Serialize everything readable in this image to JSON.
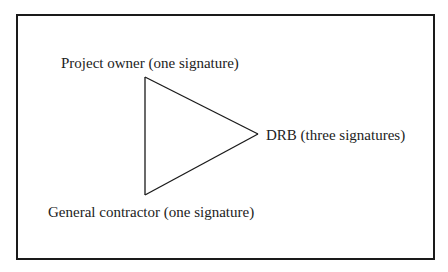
{
  "diagram": {
    "type": "triangle-signature-relationship",
    "nodes": [
      {
        "id": "owner",
        "label": "Project owner (one signature)",
        "position": "top-left vertex"
      },
      {
        "id": "contractor",
        "label": "General contractor (one signature)",
        "position": "bottom-left vertex"
      },
      {
        "id": "drb",
        "label": "DRB (three signatures)",
        "position": "right vertex"
      }
    ],
    "edges": [
      {
        "from": "owner",
        "to": "drb"
      },
      {
        "from": "contractor",
        "to": "drb"
      },
      {
        "from": "owner",
        "to": "contractor"
      }
    ],
    "colors": {
      "stroke": "#1a1a1a",
      "text": "#222222",
      "background": "#ffffff"
    }
  }
}
